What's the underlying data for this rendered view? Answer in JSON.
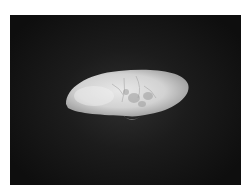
{
  "image": {
    "subject": "bivalve shell",
    "description": "Pale elongated bivalve shell photographed against a dark gradient background",
    "colors": {
      "frame": "#ffffff",
      "background_dark": "#0e0e0e",
      "background_center": "#2f2f2f",
      "shell_light": "#e6e6e6",
      "shell_mid": "#bdbdbd",
      "shell_shadow": "#8a8a8a"
    }
  }
}
